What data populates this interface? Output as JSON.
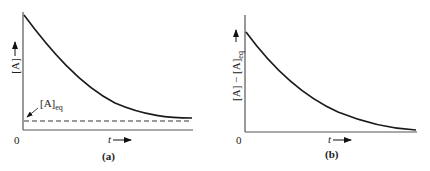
{
  "panels": [
    {
      "id": "a",
      "caption": "(a)",
      "y_label": "[A]",
      "x_label": "t",
      "origin_label": "0",
      "annotation": {
        "base": "[A]",
        "sub": "eq"
      },
      "curve": "exponential decay approaching [A]eq",
      "asymptote": "dashed horizontal line at [A]eq"
    },
    {
      "id": "b",
      "caption": "(b)",
      "y_label": "[A] − [A]",
      "y_label_sub": "eq",
      "x_label": "t",
      "origin_label": "0",
      "curve": "exponential decay approaching zero"
    }
  ],
  "colors": {
    "curve": "#1a1a1a",
    "axis": "#555555"
  }
}
